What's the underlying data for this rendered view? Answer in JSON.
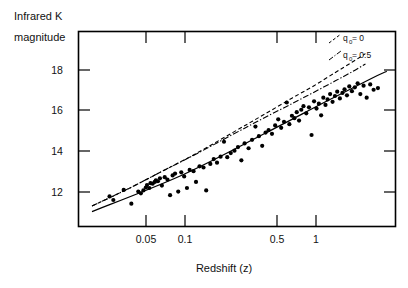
{
  "figure": {
    "title_y_line1": "Infrared K",
    "title_y_line2": "magnitude",
    "xlabel": "Redshift (z)",
    "ylabel": "Infrared K magnitude"
  },
  "legend": {
    "entries": [
      {
        "text_main": "q",
        "text_sub": "0",
        "text_rest": " = 0",
        "full": "q0 = 0",
        "style": "dashed"
      },
      {
        "text_main": "q",
        "text_sub": "0",
        "text_rest": " = 0.5",
        "full": "q0 = 0.5",
        "style": "dash-dot"
      }
    ],
    "label_0": "q",
    "sub_0": "0",
    "rest_0": " = 0",
    "label_1": "q",
    "sub_1": "0",
    "rest_1": " = 0.5"
  },
  "axes": {
    "x_ticks": [
      "0.05",
      "0.1",
      "0.5",
      "1"
    ],
    "x_tick_values": [
      0.05,
      0.1,
      0.5,
      1
    ],
    "y_ticks": [
      "18",
      "16",
      "14",
      "12"
    ],
    "y_tick_values": [
      18,
      16,
      14,
      12
    ],
    "x_range_log": [
      0.025,
      1.8
    ],
    "y_range": [
      19.2,
      11.1
    ],
    "x_scale": "log",
    "y_scale": "linear",
    "y_inverted": true
  },
  "colors": {
    "axis": "#000000",
    "points": "#000000",
    "curve": "#000000",
    "background": "#ffffff"
  },
  "chart_data": {
    "type": "scatter",
    "title": "",
    "xlabel": "Redshift (z)",
    "ylabel": "Infrared K magnitude",
    "xscale": "log",
    "xlim": [
      0.025,
      1.8
    ],
    "ylim": [
      19.2,
      11.1
    ],
    "y_inverted": true,
    "grid": false,
    "legend_position": "top-right",
    "series": [
      {
        "name": "galaxies",
        "type": "scatter",
        "marker": "filled-circle",
        "points": [
          [
            0.038,
            12.35
          ],
          [
            0.04,
            12.2
          ],
          [
            0.046,
            12.62
          ],
          [
            0.051,
            12.05
          ],
          [
            0.056,
            12.55
          ],
          [
            0.058,
            12.48
          ],
          [
            0.06,
            12.6
          ],
          [
            0.062,
            12.72
          ],
          [
            0.063,
            12.82
          ],
          [
            0.065,
            12.7
          ],
          [
            0.066,
            12.9
          ],
          [
            0.068,
            12.88
          ],
          [
            0.07,
            12.95
          ],
          [
            0.071,
            13.02
          ],
          [
            0.073,
            12.98
          ],
          [
            0.075,
            13.1
          ],
          [
            0.077,
            12.8
          ],
          [
            0.08,
            13.15
          ],
          [
            0.083,
            13.05
          ],
          [
            0.086,
            12.4
          ],
          [
            0.089,
            13.22
          ],
          [
            0.092,
            13.3
          ],
          [
            0.096,
            12.55
          ],
          [
            0.1,
            13.35
          ],
          [
            0.104,
            13.18
          ],
          [
            0.108,
            12.7
          ],
          [
            0.112,
            13.45
          ],
          [
            0.118,
            13.4
          ],
          [
            0.122,
            12.95
          ],
          [
            0.128,
            13.6
          ],
          [
            0.135,
            13.55
          ],
          [
            0.14,
            12.6
          ],
          [
            0.148,
            13.7
          ],
          [
            0.155,
            13.9
          ],
          [
            0.162,
            13.75
          ],
          [
            0.17,
            14.0
          ],
          [
            0.178,
            14.62
          ],
          [
            0.186,
            13.98
          ],
          [
            0.195,
            14.15
          ],
          [
            0.205,
            14.25
          ],
          [
            0.215,
            14.4
          ],
          [
            0.225,
            13.85
          ],
          [
            0.235,
            14.55
          ],
          [
            0.248,
            14.35
          ],
          [
            0.26,
            14.7
          ],
          [
            0.272,
            15.25
          ],
          [
            0.285,
            14.85
          ],
          [
            0.298,
            14.45
          ],
          [
            0.312,
            15.0
          ],
          [
            0.325,
            15.1
          ],
          [
            0.34,
            14.95
          ],
          [
            0.355,
            15.3
          ],
          [
            0.37,
            15.55
          ],
          [
            0.385,
            15.2
          ],
          [
            0.4,
            15.45
          ],
          [
            0.415,
            16.25
          ],
          [
            0.43,
            15.35
          ],
          [
            0.445,
            15.7
          ],
          [
            0.46,
            15.6
          ],
          [
            0.475,
            15.85
          ],
          [
            0.49,
            15.5
          ],
          [
            0.505,
            15.95
          ],
          [
            0.52,
            16.1
          ],
          [
            0.54,
            15.8
          ],
          [
            0.56,
            16.05
          ],
          [
            0.58,
            14.9
          ],
          [
            0.6,
            16.3
          ],
          [
            0.62,
            16.0
          ],
          [
            0.64,
            16.2
          ],
          [
            0.66,
            15.72
          ],
          [
            0.68,
            16.45
          ],
          [
            0.7,
            16.15
          ],
          [
            0.72,
            16.38
          ],
          [
            0.745,
            16.6
          ],
          [
            0.77,
            16.28
          ],
          [
            0.795,
            16.52
          ],
          [
            0.82,
            16.7
          ],
          [
            0.85,
            16.42
          ],
          [
            0.88,
            16.65
          ],
          [
            0.905,
            16.8
          ],
          [
            0.935,
            16.55
          ],
          [
            0.965,
            16.92
          ],
          [
            1.0,
            16.72
          ],
          [
            1.04,
            16.88
          ],
          [
            1.08,
            17.05
          ],
          [
            1.12,
            16.6
          ],
          [
            1.17,
            16.95
          ],
          [
            1.22,
            16.45
          ],
          [
            1.28,
            17.0
          ],
          [
            1.34,
            16.78
          ],
          [
            1.42,
            16.85
          ]
        ]
      },
      {
        "name": "q0 = 0",
        "type": "line",
        "style": "dashed",
        "points": [
          [
            0.03,
            11.95
          ],
          [
            0.05,
            12.7
          ],
          [
            0.08,
            13.45
          ],
          [
            0.12,
            14.1
          ],
          [
            0.2,
            15.0
          ],
          [
            0.3,
            15.72
          ],
          [
            0.45,
            16.45
          ],
          [
            0.6,
            16.95
          ],
          [
            0.8,
            17.5
          ],
          [
            1.0,
            17.92
          ],
          [
            1.2,
            18.28
          ]
        ]
      },
      {
        "name": "q0 = 0.5",
        "type": "line",
        "style": "dash-dot",
        "points": [
          [
            0.03,
            11.95
          ],
          [
            0.05,
            12.7
          ],
          [
            0.08,
            13.45
          ],
          [
            0.12,
            14.08
          ],
          [
            0.2,
            14.92
          ],
          [
            0.3,
            15.58
          ],
          [
            0.45,
            16.22
          ],
          [
            0.6,
            16.68
          ],
          [
            0.8,
            17.15
          ],
          [
            1.0,
            17.52
          ],
          [
            1.2,
            17.85
          ]
        ]
      },
      {
        "name": "linear fit",
        "type": "line",
        "style": "solid",
        "points": [
          [
            0.03,
            11.72
          ],
          [
            0.1,
            13.22
          ],
          [
            0.3,
            14.92
          ],
          [
            0.7,
            16.28
          ],
          [
            1.3,
            17.25
          ],
          [
            1.6,
            17.55
          ]
        ]
      }
    ]
  }
}
